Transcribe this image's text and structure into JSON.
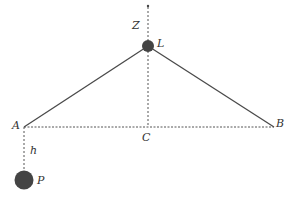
{
  "diagram": {
    "type": "geometry",
    "colors": {
      "line": "#4a4a4a",
      "dashed": "#555555",
      "node": "#444444",
      "label": "#333333",
      "background": "#ffffff"
    },
    "points": {
      "top": {
        "x": 148,
        "y": 6
      },
      "L": {
        "x": 148,
        "y": 46,
        "label": "L",
        "radius": 6
      },
      "A": {
        "x": 24,
        "y": 127,
        "label": "A"
      },
      "B": {
        "x": 274,
        "y": 127,
        "label": "B"
      },
      "C": {
        "x": 148,
        "y": 127,
        "label": "C"
      },
      "P": {
        "x": 24,
        "y": 180,
        "label": "P",
        "radius": 9
      }
    },
    "labels": {
      "Z": "Z",
      "L": "L",
      "A": "A",
      "B": "B",
      "C": "C",
      "h": "h",
      "P": "P"
    },
    "segments": [
      {
        "from": "L",
        "to": "A",
        "style": "solid"
      },
      {
        "from": "L",
        "to": "B",
        "style": "solid"
      },
      {
        "from": "A",
        "to": "B",
        "style": "dashed"
      },
      {
        "from": "top",
        "to": "C",
        "style": "dashed"
      },
      {
        "from": "A",
        "to": "P",
        "style": "dashed"
      }
    ]
  }
}
